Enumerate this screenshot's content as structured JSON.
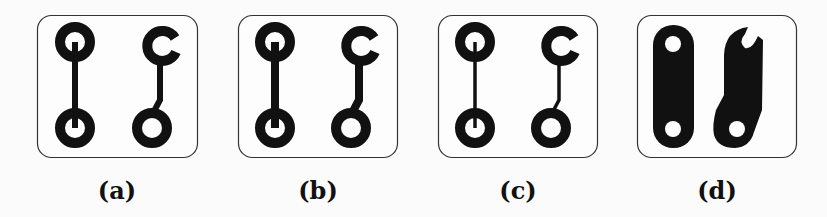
{
  "figure": {
    "panels": [
      {
        "id": "a",
        "label": "(a)",
        "description": "thin traces, round pads"
      },
      {
        "id": "b",
        "label": "(b)",
        "description": "medium traces, round pads"
      },
      {
        "id": "c",
        "label": "(c)",
        "description": "thinnest traces, round pads"
      },
      {
        "id": "d",
        "label": "(d)",
        "description": "filled copper regions"
      }
    ],
    "colors": {
      "ink": "#111111",
      "background": "#fbfbfb",
      "border": "#333333"
    }
  }
}
